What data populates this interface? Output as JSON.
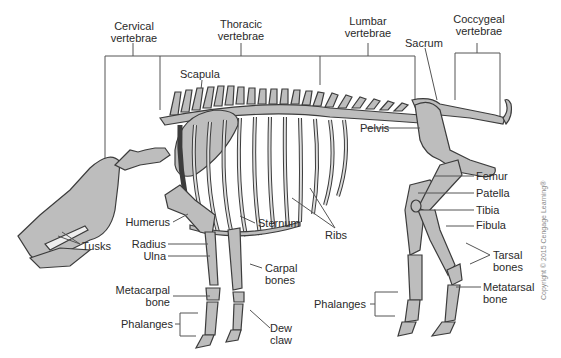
{
  "diagram": {
    "colors": {
      "bone_fill": "#bdbdbd",
      "bone_stroke": "#3c3c3c",
      "leader": "#555555",
      "text": "#2a2a2a",
      "background": "#ffffff"
    },
    "labels": {
      "cervical_1": "Cervical",
      "cervical_2": "vertebrae",
      "thoracic_1": "Thoracic",
      "thoracic_2": "vertebrae",
      "lumbar_1": "Lumbar",
      "lumbar_2": "vertebrae",
      "coccygeal_1": "Coccygeal",
      "coccygeal_2": "vertebrae",
      "sacrum": "Sacrum",
      "scapula": "Scapula",
      "pelvis": "Pelvis",
      "femur": "Femur",
      "patella": "Patella",
      "tibia": "Tibia",
      "fibula": "Fibula",
      "tarsal_1": "Tarsal",
      "tarsal_2": "bones",
      "metatarsal_1": "Metatarsal",
      "metatarsal_2": "bone",
      "phalanges_hind": "Phalanges",
      "humerus": "Humerus",
      "radius": "Radius",
      "ulna": "Ulna",
      "tusks": "Tusks",
      "sternum": "Sternum",
      "ribs": "Ribs",
      "carpal_1": "Carpal",
      "carpal_2": "bones",
      "metacarpal_1": "Metacarpal",
      "metacarpal_2": "bone",
      "phalanges_fore": "Phalanges",
      "dew_1": "Dew",
      "dew_2": "claw"
    },
    "copyright": "Copyright © 2015 Cengage Learning®"
  }
}
